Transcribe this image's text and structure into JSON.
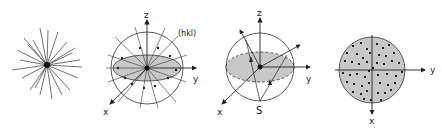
{
  "figure": {
    "panels": [
      {
        "id": "a",
        "description": "bundle of plane normals radiating from a point"
      },
      {
        "id": "b",
        "labels": {
          "z": "z",
          "y": "y",
          "x": "x",
          "plane": "(hkl)"
        }
      },
      {
        "id": "c",
        "labels": {
          "z": "z",
          "y": "y",
          "x": "x",
          "pole": "S"
        }
      },
      {
        "id": "d",
        "labels": {
          "y": "y",
          "x": "x"
        }
      }
    ]
  },
  "colors": {
    "line": "#2a2a2a",
    "fill": "#c8c8c8",
    "dot": "#222222",
    "background": "#ffffff"
  }
}
